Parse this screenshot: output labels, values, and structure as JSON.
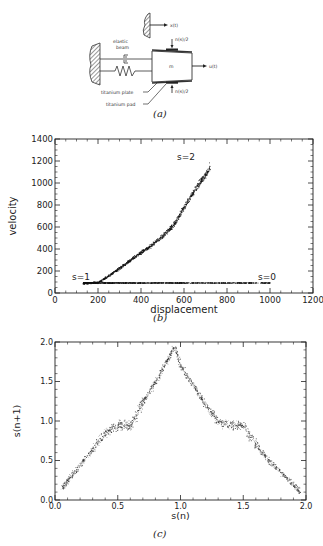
{
  "panel_a": {
    "caption": "(a)",
    "labels": {
      "x_t": "x(t)",
      "elastic_beam_line1": "elastic",
      "elastic_beam_line2": "beam",
      "normal_top": "n(s)/2",
      "normal_bottom": "n(s)/2",
      "mass": "m",
      "u_t": "u(t)",
      "titanium_plate": "titanium plate",
      "titanium_pad": "titanium pad"
    }
  },
  "panel_b": {
    "caption": "(b)",
    "annotations": {
      "s2": "s=2",
      "s1": "s=1",
      "s0": "s=0"
    }
  },
  "panel_c": {
    "caption": "(c)"
  },
  "chart_data": [
    {
      "type": "scatter",
      "title": "",
      "panel": "(b)",
      "xlabel": "displacement",
      "ylabel": "velocity",
      "xlim": [
        0,
        1200
      ],
      "ylim": [
        0,
        1400
      ],
      "xticks": [
        0,
        200,
        400,
        600,
        800,
        1000,
        1200
      ],
      "yticks": [
        0,
        200,
        400,
        600,
        800,
        1000,
        1200,
        1400
      ],
      "grid": false,
      "annotations": [
        {
          "text": "s=2",
          "x": 640,
          "y": 1180
        },
        {
          "text": "s=1",
          "x": 150,
          "y": 150
        },
        {
          "text": "s=0",
          "x": 1000,
          "y": 150
        }
      ],
      "series": [
        {
          "name": "rising branch (s=1 to s=2)",
          "x": [
            130,
            200,
            250,
            300,
            350,
            400,
            450,
            500,
            550,
            580,
            620,
            660,
            700,
            720
          ],
          "y": [
            90,
            100,
            160,
            230,
            300,
            370,
            440,
            520,
            620,
            720,
            850,
            970,
            1080,
            1150
          ]
        },
        {
          "name": "flat branch (s=1 to s=0)",
          "x": [
            130,
            300,
            500,
            700,
            900,
            1000
          ],
          "y": [
            95,
            95,
            95,
            95,
            95,
            95
          ]
        }
      ]
    },
    {
      "type": "scatter",
      "title": "",
      "panel": "(c)",
      "xlabel": "s(n)",
      "ylabel": "s(n+1)",
      "xlim": [
        0.0,
        2.0
      ],
      "ylim": [
        0.0,
        2.0
      ],
      "xticks": [
        0.0,
        0.5,
        1.0,
        1.5,
        2.0
      ],
      "yticks": [
        0.0,
        0.5,
        1.0,
        1.5,
        2.0
      ],
      "grid": false,
      "series": [
        {
          "name": "return map",
          "x": [
            0.05,
            0.1,
            0.2,
            0.3,
            0.4,
            0.5,
            0.6,
            0.7,
            0.8,
            0.9,
            0.95,
            1.0,
            1.1,
            1.2,
            1.3,
            1.4,
            1.5,
            1.6,
            1.7,
            1.8,
            1.9,
            1.95
          ],
          "y": [
            0.15,
            0.25,
            0.45,
            0.65,
            0.85,
            0.95,
            0.95,
            1.25,
            1.5,
            1.8,
            1.95,
            1.7,
            1.45,
            1.2,
            1.0,
            0.95,
            0.95,
            0.7,
            0.5,
            0.35,
            0.2,
            0.1
          ]
        }
      ]
    }
  ]
}
